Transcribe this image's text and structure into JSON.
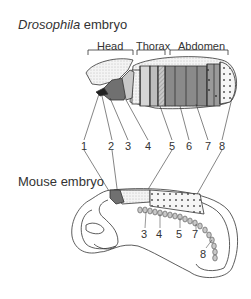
{
  "drosophila": {
    "title_italic": "Drosophila",
    "title_rest": " embryo",
    "regions": [
      "Head",
      "Thorax",
      "Abdomen"
    ],
    "numbers": [
      "1",
      "2",
      "3",
      "4",
      "5",
      "6",
      "7",
      "8"
    ]
  },
  "mouse": {
    "title": "Mouse embryo",
    "numbers": [
      "3",
      "4",
      "5",
      "7",
      "8"
    ]
  },
  "colors": {
    "line": "#333333",
    "light_stipple": "#e8e8e8",
    "mid_gray": "#a8a8a8",
    "dark_gray": "#707070"
  }
}
